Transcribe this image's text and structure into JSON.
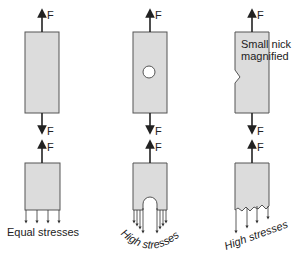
{
  "force_label": "F",
  "panels": [
    {
      "id": "plain",
      "caption": "Equal stresses"
    },
    {
      "id": "hole",
      "caption": "High stresses"
    },
    {
      "id": "nick",
      "caption": "High stresses",
      "note_line1": "Small nick",
      "note_line2": "magnified"
    }
  ]
}
